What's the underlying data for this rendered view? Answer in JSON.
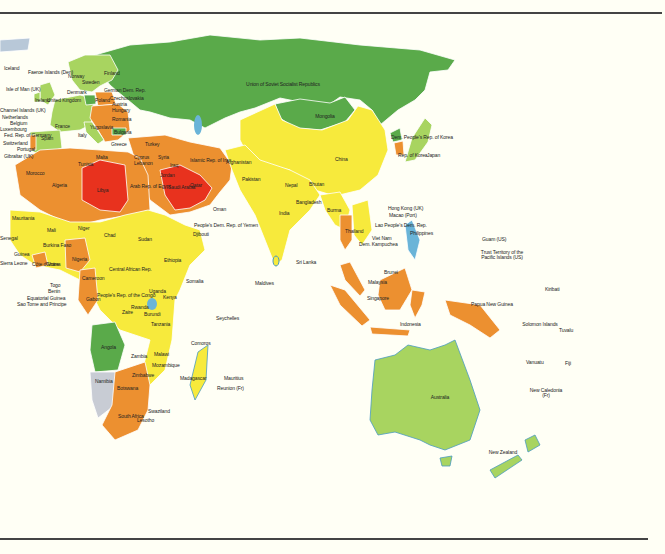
{
  "legend_colors": {
    "dark_green": "#5aaa4a",
    "light_green": "#a8d460",
    "yellow": "#f7ea3c",
    "orange": "#ec9030",
    "red": "#e8321e",
    "gray": "#c8ccd4",
    "water": "#6ab4d8",
    "background": "#fffff5"
  },
  "labels": {
    "iceland": "Iceland",
    "faeroe": "Faeroe Islands (Den)",
    "norway": "Norway",
    "sweden": "Sweden",
    "finland": "Finland",
    "isle_of_man": "Isle of Man (UK)",
    "ireland": "Ireland",
    "uk": "United Kingdom",
    "denmark": "Denmark",
    "gdr": "German Dem. Rep.",
    "poland": "Poland",
    "czech": "Czechoslovakia",
    "austria": "Austria",
    "hungary": "Hungary",
    "channel": "Channel Islands (UK)",
    "netherlands": "Netherlands",
    "belgium": "Belgium",
    "luxembourg": "Luxembourg",
    "frg": "Fed. Rep. of Germany",
    "switzerland": "Switzerland",
    "portugal": "Portugal",
    "gibraltar": "Gibraltar (UK)",
    "france": "France",
    "spain": "Spain",
    "italy": "Italy",
    "yugoslavia": "Yugoslavia",
    "romania": "Romania",
    "bulgaria": "Bulgaria",
    "greece": "Greece",
    "albania": "Albania",
    "malta": "Malta",
    "ussr": "Union of Soviet Socialist Republics",
    "mongolia": "Mongolia",
    "turkey": "Turkey",
    "cyprus": "Cyprus",
    "lebanon": "Lebanon",
    "syria": "Syria",
    "iraq": "Iraq",
    "iran": "Islamic Rep. of Iran",
    "jordan": "Jordan",
    "kuwait": "Kuwait",
    "saudi": "Saudi Arabia",
    "qatar": "Qatar",
    "uae": "United Arab Emirates",
    "oman": "Oman",
    "yemen": "People's Dem. Rep. of Yemen",
    "egypt": "Arab Rep. of Egypt",
    "libya": "Libya",
    "tunisia": "Tunisia",
    "algeria": "Algeria",
    "morocco": "Morocco",
    "western_sahara": "Western Sahara",
    "mauritania": "Mauritania",
    "mali": "Mali",
    "niger": "Niger",
    "chad": "Chad",
    "sudan": "Sudan",
    "senegal": "Senegal",
    "guinea": "Guinea",
    "sierra_leone": "Sierra Leone",
    "liberia": "Liberia",
    "ivory": "Côte d'Ivoire",
    "ghana": "Ghana",
    "burkina": "Burkina Faso",
    "nigeria": "Nigeria",
    "togo": "Togo",
    "benin": "Benin",
    "eq_guinea": "Equatorial Guinea",
    "sao_tome": "Sao Tome and Principe",
    "cameroon": "Cameroon",
    "car": "Central African Rep.",
    "ethiopia": "Ethiopia",
    "djibouti": "Djibouti",
    "somalia": "Somalia",
    "gabon": "Gabon",
    "congo": "People's Rep. of the Congo",
    "zaire": "Zaire",
    "uganda": "Uganda",
    "kenya": "Kenya",
    "rwanda": "Rwanda",
    "burundi": "Burundi",
    "tanzania": "Tanzania",
    "seychelles": "Seychelles",
    "angola": "Angola",
    "zambia": "Zambia",
    "malawi": "Malawi",
    "mozambique": "Mozambique",
    "comoros": "Comoros",
    "madagascar": "Madagascar",
    "mauritius": "Mauritius",
    "reunion": "Reunion (Fr)",
    "namibia": "Namibia",
    "zimbabwe": "Zimbabwe",
    "botswana": "Botswana",
    "swaziland": "Swaziland",
    "south_africa": "South Africa",
    "lesotho": "Lesotho",
    "afghanistan": "Afghanistan",
    "pakistan": "Pakistan",
    "nepal": "Nepal",
    "bhutan": "Bhutan",
    "india": "India",
    "bangladesh": "Bangladesh",
    "sri_lanka": "Sri Lanka",
    "maldives": "Maldives",
    "china": "China",
    "burma": "Burma",
    "thailand": "Thailand",
    "laos": "Lao People's Dem. Rep.",
    "vietnam": "Viet Nam",
    "kampuchea": "Dem. Kampuchea",
    "hongkong": "Hong Kong (UK)",
    "macao": "Macao (Port)",
    "dprk": "Dem. People's Rep. of Korea",
    "korea": "Rep. of Korea",
    "japan": "Japan",
    "philippines": "Philippines",
    "malaysia": "Malaysia",
    "brunei": "Brunei",
    "singapore": "Singapore",
    "indonesia": "Indonesia",
    "png": "Papua New Guinea",
    "guam": "Guam (US)",
    "trust": "Trust Territory of the Pacific Islands (US)",
    "kiribati": "Kiribati",
    "solomon": "Solomon Islands",
    "tuvalu": "Tuvalu",
    "vanuatu": "Vanuatu",
    "fiji": "Fiji",
    "new_caledonia": "New Caledonia (Fr)",
    "australia": "Australia",
    "new_zealand": "New Zealand"
  }
}
